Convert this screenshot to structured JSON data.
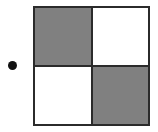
{
  "figure": {
    "kind": "checkerboard-pattern",
    "width": 158,
    "height": 132,
    "background_color": "#ffffff"
  },
  "marker": {
    "name": "bullet-dot",
    "shape": "circle",
    "color": "#111111",
    "diameter": 9,
    "center_x": 12,
    "center_y": 65
  },
  "board": {
    "border_color": "#2b2b2b",
    "border_width": 2,
    "filled_color": "#808080",
    "empty_color": "#ffffff",
    "rows": 2,
    "columns": 2,
    "cells": [
      {
        "position": "top-left",
        "state": "filled",
        "label": ""
      },
      {
        "position": "top-right",
        "state": "empty",
        "label": ""
      },
      {
        "position": "bottom-left",
        "state": "empty",
        "label": ""
      },
      {
        "position": "bottom-right",
        "state": "filled",
        "label": ""
      }
    ]
  }
}
